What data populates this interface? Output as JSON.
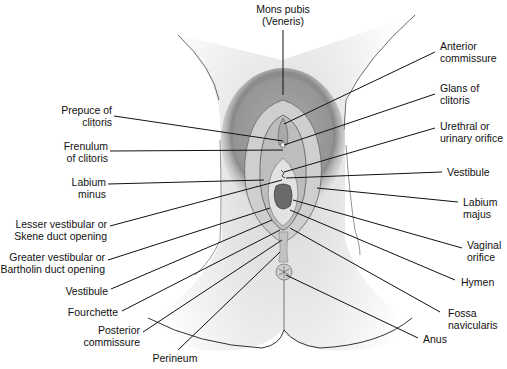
{
  "diagram": {
    "labels": [
      {
        "id": "mons-pubis",
        "text": "Mons pubis\n(Veneris)",
        "x": 250,
        "y": 3,
        "w": 66,
        "align": "c",
        "line": [
          283,
          30,
          283,
          95
        ]
      },
      {
        "id": "anterior-commissure",
        "text": "Anterior\ncommissure",
        "x": 440,
        "y": 40,
        "w": 70,
        "align": "l",
        "line": [
          435,
          52,
          284,
          124
        ]
      },
      {
        "id": "glans-of-clitoris",
        "text": "Glans of\nclitoris",
        "x": 440,
        "y": 82,
        "w": 70,
        "align": "l",
        "line": [
          435,
          94,
          284,
          145
        ]
      },
      {
        "id": "urethral-orifice",
        "text": "Urethral or\nurinary orifice",
        "x": 440,
        "y": 120,
        "w": 70,
        "align": "l",
        "line": [
          435,
          128,
          284,
          172
        ]
      },
      {
        "id": "vestibule-right",
        "text": "Vestibule",
        "x": 447,
        "y": 166,
        "w": 60,
        "align": "l",
        "line": [
          442,
          172,
          286,
          178
        ]
      },
      {
        "id": "labium-majus",
        "text": "Labium\nmajus",
        "x": 463,
        "y": 196,
        "w": 44,
        "align": "l",
        "line": [
          458,
          202,
          317,
          188
        ]
      },
      {
        "id": "vaginal-orifice",
        "text": "Vaginal\norifice",
        "x": 467,
        "y": 239,
        "w": 44,
        "align": "l",
        "line": [
          462,
          248,
          293,
          200
        ]
      },
      {
        "id": "hymen",
        "text": "Hymen",
        "x": 461,
        "y": 276,
        "w": 44,
        "align": "l",
        "line": [
          455,
          280,
          290,
          210
        ]
      },
      {
        "id": "fossa-navicularis",
        "text": "Fossa\nnavicularis",
        "x": 448,
        "y": 307,
        "w": 60,
        "align": "l",
        "line": [
          440,
          312,
          290,
          228
        ]
      },
      {
        "id": "anus",
        "text": "Anus",
        "x": 423,
        "y": 333,
        "w": 40,
        "align": "l",
        "line": [
          418,
          338,
          286,
          275
        ]
      },
      {
        "id": "prepuce-of-clitoris",
        "text": "Prepuce of\nclitoris",
        "x": 30,
        "y": 104,
        "w": 82,
        "align": "r",
        "line": [
          114,
          116,
          283,
          141
        ]
      },
      {
        "id": "frenulum-of-clitoris",
        "text": "Frenulum\nof clitoris",
        "x": 30,
        "y": 140,
        "w": 78,
        "align": "r",
        "line": [
          110,
          151,
          283,
          150
        ]
      },
      {
        "id": "labium-minus",
        "text": "Labium\nminus",
        "x": 30,
        "y": 176,
        "w": 76,
        "align": "r",
        "line": [
          108,
          184,
          264,
          180
        ]
      },
      {
        "id": "lesser-vestibular",
        "text": "Lesser vestibular or\nSkene duct opening",
        "x": 0,
        "y": 218,
        "w": 107,
        "align": "r",
        "line": [
          110,
          226,
          282,
          180
        ]
      },
      {
        "id": "greater-vestibular",
        "text": "Greater vestibular or\nBartholin duct opening",
        "x": 0,
        "y": 251,
        "w": 105,
        "align": "r",
        "line": [
          108,
          260,
          270,
          208
        ]
      },
      {
        "id": "vestibule-left",
        "text": "Vestibule",
        "x": 30,
        "y": 285,
        "w": 78,
        "align": "r",
        "line": [
          111,
          289,
          272,
          220
        ]
      },
      {
        "id": "fourchette",
        "text": "Fourchette",
        "x": 30,
        "y": 306,
        "w": 88,
        "align": "r",
        "line": [
          122,
          311,
          280,
          230
        ]
      },
      {
        "id": "posterior-commissure",
        "text": "Posterior\ncommissure",
        "x": 60,
        "y": 324,
        "w": 80,
        "align": "r",
        "line": [
          143,
          332,
          282,
          240
        ]
      },
      {
        "id": "perineum",
        "text": "Perineum",
        "x": 145,
        "y": 352,
        "w": 60,
        "align": "c",
        "line": [
          178,
          350,
          280,
          252
        ]
      }
    ],
    "colors": {
      "background": "#ffffff",
      "skin": "#e6e6e6",
      "skin_shadow": "#c8c8c8",
      "hair": "#555555",
      "tissue": "#b0b0b0",
      "orifice": "#6a6a6a",
      "outline": "#333333",
      "leader_line": "#111111"
    }
  }
}
